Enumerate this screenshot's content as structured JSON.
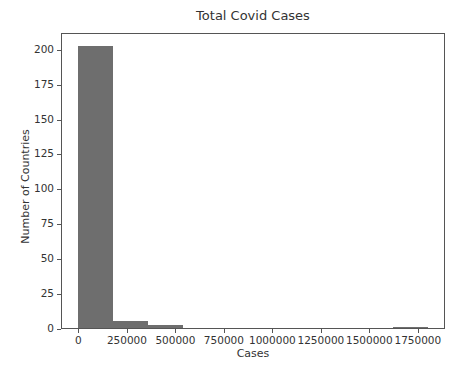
{
  "chart_data": {
    "type": "bar",
    "subtype": "histogram",
    "title": "Total Covid Cases",
    "xlabel": "Cases",
    "ylabel": "Number of Countries",
    "bin_edges": [
      0,
      180000,
      360000,
      540000,
      720000,
      900000,
      1080000,
      1260000,
      1440000,
      1620000,
      1800000
    ],
    "values": [
      202,
      5,
      2,
      0,
      0,
      0,
      0,
      0,
      0,
      1
    ],
    "xticks": [
      0,
      250000,
      500000,
      750000,
      1000000,
      1250000,
      1500000,
      1750000
    ],
    "xtick_labels": [
      "0",
      "250000",
      "500000",
      "750000",
      "1000000",
      "1250000",
      "1500000",
      "1750000"
    ],
    "yticks": [
      0,
      25,
      50,
      75,
      100,
      125,
      150,
      175,
      200
    ],
    "ytick_labels": [
      "0",
      "25",
      "50",
      "75",
      "100",
      "125",
      "150",
      "175",
      "200"
    ],
    "xlim": [
      -90000,
      1890000
    ],
    "ylim": [
      0,
      212
    ],
    "grid": false,
    "legend": null,
    "bar_color": "#6e6e6e"
  }
}
